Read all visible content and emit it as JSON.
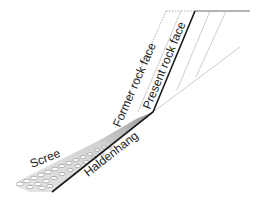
{
  "diagram": {
    "type": "slope-cross-section",
    "labels": {
      "former_rock_face": "Former rock face",
      "present_rock_face": "Present rock face",
      "scree": "Scree",
      "haldenhang": "Haldenhang"
    },
    "colors": {
      "bold_line": "#1a1a1a",
      "thin_line": "#b0b0b0",
      "dotted_line": "#9a9a9a",
      "scree_fill": "#cfcfcf",
      "text": "#222222"
    }
  }
}
